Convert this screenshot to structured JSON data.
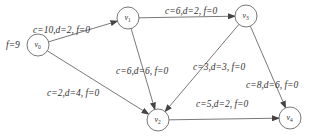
{
  "nodes": [
    {
      "id": "v0",
      "label": "v",
      "sub": "0"
    },
    {
      "id": "v1",
      "label": "v",
      "sub": "1"
    },
    {
      "id": "v2",
      "label": "v",
      "sub": "2"
    },
    {
      "id": "v3",
      "label": "v",
      "sub": "3"
    },
    {
      "id": "v4",
      "label": "v",
      "sub": "4"
    }
  ],
  "source_flow_label": "f=9",
  "edges": [
    {
      "from": "v0",
      "to": "v1",
      "label": "c=10,d=2, f=0"
    },
    {
      "from": "v1",
      "to": "v3",
      "label": "c=6,d=2, f=0"
    },
    {
      "from": "v1",
      "to": "v2",
      "label": "c=6,d=6, f=0"
    },
    {
      "from": "v0",
      "to": "v2",
      "label": "c=2,d=4, f=0"
    },
    {
      "from": "v3",
      "to": "v2",
      "label": "c=3,d=3, f=0"
    },
    {
      "from": "v3",
      "to": "v4",
      "label": "c=8,d=6, f=0"
    },
    {
      "from": "v2",
      "to": "v4",
      "label": "c=5,d=2, f=0"
    }
  ],
  "colors": {
    "stroke": "#555555",
    "text": "#333333"
  }
}
